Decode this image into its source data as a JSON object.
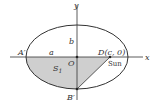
{
  "diagram": {
    "labels": {
      "y_axis": "y",
      "x_axis": "x",
      "b": "b",
      "a": "a",
      "A_prime": "A′",
      "O": "O",
      "D": "D(c, 0)",
      "sun": "Sun",
      "S1": "S",
      "S1_sub": "1",
      "B_prime": "B′"
    },
    "colors": {
      "stroke": "#333333",
      "shade": "#cfcfcf"
    }
  }
}
